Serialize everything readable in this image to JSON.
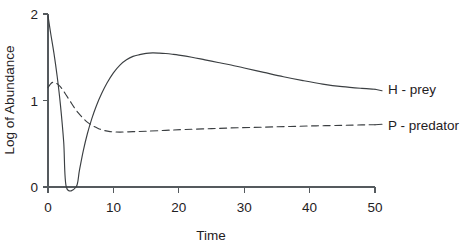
{
  "chart_data": {
    "type": "line",
    "title": "",
    "subtitle": "",
    "xlabel": "Time",
    "ylabel": "Log of Abundance",
    "xlim": [
      0,
      50
    ],
    "ylim": [
      0,
      2
    ],
    "xticks": [
      0,
      10,
      20,
      30,
      40,
      50
    ],
    "xtick_labels": [
      "0",
      "10",
      "20",
      "30",
      "40",
      "50"
    ],
    "yticks": [
      0,
      1,
      2
    ],
    "ytick_labels": [
      "0",
      "1",
      "2"
    ],
    "grid": false,
    "legend_position": "right-inline",
    "series": [
      {
        "name": "H - prey",
        "style": "solid",
        "color": "#3b3f42",
        "x": [
          0,
          0.4,
          0.9,
          1.4,
          1.9,
          2.4,
          2.8,
          4.3,
          4.8,
          5.4,
          6.0,
          6.7,
          7.4,
          8.2,
          9.0,
          10.0,
          11.0,
          12.0,
          13.0,
          14.0,
          15.0,
          16.0,
          17.0,
          18.0,
          19.0,
          20.0,
          22.0,
          24.0,
          26.0,
          28.0,
          30.0,
          33.0,
          36.0,
          39.0,
          42.0,
          45.0,
          48.0,
          50.0
        ],
        "y": [
          1.98,
          1.78,
          1.55,
          1.28,
          0.95,
          0.52,
          0.0,
          0.0,
          0.19,
          0.42,
          0.61,
          0.79,
          0.94,
          1.08,
          1.2,
          1.32,
          1.41,
          1.47,
          1.51,
          1.53,
          1.545,
          1.55,
          1.548,
          1.543,
          1.535,
          1.525,
          1.5,
          1.47,
          1.44,
          1.41,
          1.375,
          1.325,
          1.275,
          1.23,
          1.19,
          1.16,
          1.14,
          1.13
        ]
      },
      {
        "name": "P - predator",
        "style": "dashed",
        "color": "#3b3f42",
        "x": [
          0,
          0.5,
          1.0,
          1.6,
          2.2,
          2.8,
          3.4,
          4.0,
          4.6,
          5.3,
          6.0,
          6.8,
          7.6,
          8.5,
          9.5,
          11.0,
          13.0,
          15.0,
          18.0,
          21.0,
          25.0,
          29.0,
          33.0,
          37.0,
          41.0,
          45.0,
          48.0,
          50.0
        ],
        "y": [
          1.15,
          1.2,
          1.21,
          1.18,
          1.13,
          1.06,
          0.99,
          0.92,
          0.86,
          0.8,
          0.75,
          0.71,
          0.68,
          0.655,
          0.64,
          0.635,
          0.64,
          0.645,
          0.655,
          0.665,
          0.675,
          0.685,
          0.692,
          0.7,
          0.707,
          0.713,
          0.718,
          0.72
        ]
      }
    ],
    "legend_entries": [
      {
        "label": "H - prey",
        "style": "solid"
      },
      {
        "label": "P - predator",
        "style": "dashed"
      }
    ]
  },
  "geometry": {
    "plot_left": 48,
    "plot_right": 375,
    "plot_top": 14,
    "plot_bottom": 187
  }
}
